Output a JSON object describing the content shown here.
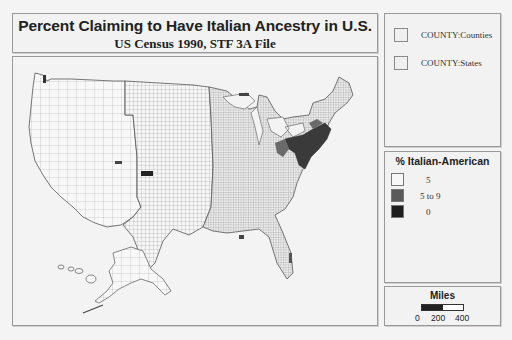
{
  "title": {
    "main": "Percent Claiming to Have Italian Ancestry in U.S.",
    "subtitle": "US Census 1990, STF 3A File"
  },
  "layers": [
    {
      "label": "COUNTY:Counties"
    },
    {
      "label": "COUNTY:States"
    }
  ],
  "legend": {
    "title": "% Italian-American",
    "items": [
      {
        "label": "5",
        "color": "#f7f7f7"
      },
      {
        "label": "5 to   9",
        "color": "#5a5a5a"
      },
      {
        "label": "0",
        "color": "#1e1e1e"
      }
    ]
  },
  "scale": {
    "title": "Miles",
    "ticks": [
      "0",
      "200",
      "400"
    ]
  },
  "map": {
    "region": "United States (counties)",
    "high_concentration_regions": [
      "Northeast (NY, NJ, PA, CT, MA, RI)",
      "South Florida",
      "Colorado",
      "New Orleans area",
      "Northern Michigan"
    ]
  }
}
